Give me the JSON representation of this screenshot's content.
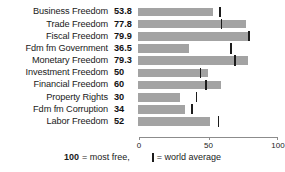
{
  "chart_data": {
    "type": "bar",
    "orientation": "horizontal",
    "title": "",
    "xlabel": "",
    "ylabel": "",
    "xlim": [
      0,
      100
    ],
    "grid": false,
    "axis_ticks": [
      "0",
      "50",
      "100"
    ],
    "axis_tick_values": [
      0,
      50,
      100
    ],
    "categories": [
      "Business Freedom",
      "Trade Freedom",
      "Fiscal Freedom",
      "Fdm fm Government",
      "Monetary Freedom",
      "Investment Freedom",
      "Financial Freedom",
      "Property Rights",
      "Fdm fm Corruption",
      "Labor Freedom"
    ],
    "values": [
      53.8,
      77.8,
      79.9,
      36.5,
      79.3,
      50,
      60,
      30,
      34,
      52
    ],
    "value_labels": [
      "53.8",
      "77.8",
      "79.9",
      "36.5",
      "79.3",
      "50",
      "60",
      "30",
      "34",
      "52"
    ],
    "series": [
      {
        "name": "Country score",
        "values": [
          53.8,
          77.8,
          79.9,
          36.5,
          79.3,
          50,
          60,
          30,
          34,
          52
        ]
      },
      {
        "name": "world average",
        "marker": "vertical-line",
        "values": [
          59,
          60,
          80,
          67,
          70,
          45,
          49,
          42,
          39,
          58
        ]
      }
    ],
    "colors": {
      "bar": "#a3a3a3",
      "world_average_marker": "#1c1c1c",
      "axis": "#8c8c8c",
      "text": "#1a1a1a",
      "background": "#ffffff"
    }
  },
  "footer": {
    "max_value": "100",
    "most_free_text": "= most free,",
    "world_average_text": "= world average"
  }
}
